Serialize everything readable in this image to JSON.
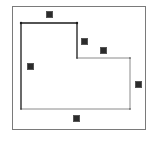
{
  "diagram": {
    "type": "l-shaped-polygon",
    "frame": {
      "x": 12,
      "y": 6,
      "width": 134,
      "height": 124,
      "color": "#7a7a7a"
    },
    "polygon": {
      "points": [
        [
          21,
          23
        ],
        [
          77,
          23
        ],
        [
          77,
          58
        ],
        [
          130,
          58
        ],
        [
          130,
          109
        ],
        [
          21,
          109
        ]
      ],
      "stroke_dark": "#1a1a1a",
      "stroke_light": "#8a8a8a"
    },
    "labels": [
      {
        "id": "top",
        "x": 46,
        "y": 11,
        "text": ""
      },
      {
        "id": "step-vertical",
        "x": 81,
        "y": 38,
        "text": ""
      },
      {
        "id": "step-horizontal",
        "x": 100,
        "y": 47,
        "text": ""
      },
      {
        "id": "left",
        "x": 27,
        "y": 63,
        "text": ""
      },
      {
        "id": "right",
        "x": 135,
        "y": 81,
        "text": ""
      },
      {
        "id": "bottom",
        "x": 73,
        "y": 115,
        "text": ""
      }
    ]
  }
}
